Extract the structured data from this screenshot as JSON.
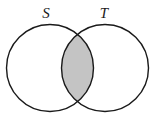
{
  "diagram": {
    "type": "venn",
    "sets": [
      {
        "id": "S",
        "label": "S",
        "cx": 50,
        "cy": 68,
        "r": 43.5,
        "label_x": 46,
        "label_y": 18
      },
      {
        "id": "T",
        "label": "T",
        "cx": 105,
        "cy": 68,
        "r": 43.5,
        "label_x": 104,
        "label_y": 18
      }
    ],
    "shaded_region": "S ∩ T",
    "colors": {
      "outline": "#1a1a1a",
      "shade": "#c4c4c4",
      "background": "#ffffff"
    }
  }
}
